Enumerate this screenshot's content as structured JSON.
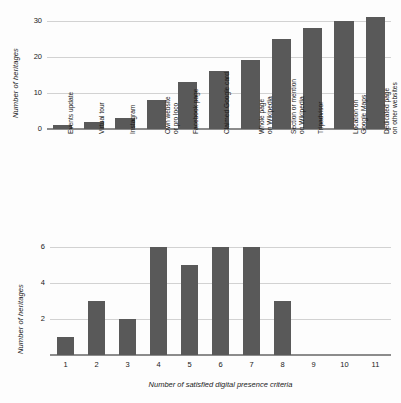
{
  "figure": {
    "background": "#fdfdfd",
    "bar_color": "#595959",
    "grid_color": "#d2d2d2",
    "axis_color": "#8c8c8c"
  },
  "chart_data": [
    {
      "id": "top",
      "type": "bar",
      "title": "",
      "xlabel": "",
      "ylabel": "Number of heritages",
      "ylim": [
        0,
        31.8
      ],
      "yticks": [
        0,
        10,
        20,
        30
      ],
      "ytick_labels": [
        "0",
        "10",
        "20",
        "30"
      ],
      "grid": true,
      "legend": "none",
      "orientation": "vertical",
      "categories": [
        "Events update",
        "Virtual tour",
        "Instagram",
        "Own website\nor pro loco",
        "Facebook page",
        "Claimed Google card",
        "Whole page\non Wikipedia",
        "Section or mention\non Wikipedia",
        "Tripadvisor",
        "Location on\nGoogle Maps",
        "Dedicated page\non other websites"
      ],
      "category_lines": [
        [
          "Events update"
        ],
        [
          "Virtual tour"
        ],
        [
          "Instagram"
        ],
        [
          "Own website",
          "or pro loco"
        ],
        [
          "Facebook page"
        ],
        [
          "Claimed Google card"
        ],
        [
          "Whole page",
          "on Wikipedia"
        ],
        [
          "Section or mention",
          "on Wikipedia"
        ],
        [
          "Tripadvisor"
        ],
        [
          "Location on",
          "Google Maps"
        ],
        [
          "Dedicated page",
          "on other websites"
        ]
      ],
      "values": [
        1,
        2,
        3,
        8,
        13,
        16,
        19,
        25,
        28,
        30,
        31
      ]
    },
    {
      "id": "bottom",
      "type": "bar",
      "title": "",
      "xlabel": "Number of satisfied digital presence criteria",
      "ylabel": "Number of heritages",
      "ylim": [
        0,
        6.3
      ],
      "yticks": [
        2,
        4,
        6
      ],
      "ytick_labels": [
        "2",
        "4",
        "6"
      ],
      "grid": true,
      "legend": "none",
      "orientation": "vertical",
      "categories": [
        "1",
        "2",
        "3",
        "4",
        "5",
        "6",
        "7",
        "8",
        "9",
        "10",
        "11"
      ],
      "values": [
        1,
        3,
        2,
        6,
        5,
        6,
        6,
        3,
        0,
        0,
        0
      ]
    }
  ]
}
